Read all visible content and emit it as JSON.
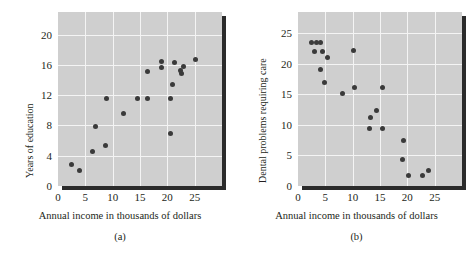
{
  "figure": {
    "background_color": "#ffffff",
    "plot_background_color": "#cfcfcf",
    "grid_color": "#f4f4f4",
    "point_color": "#3a3a3a",
    "axis_color": "#231f20"
  },
  "chart_data": [
    {
      "type": "scatter",
      "panel_label": "(a)",
      "title": "",
      "xlabel": "Annual income in thousands of dollars",
      "ylabel": "Years of education",
      "xlim": [
        0,
        30
      ],
      "ylim": [
        0,
        23
      ],
      "xticks": [
        0,
        5,
        10,
        15,
        20,
        25
      ],
      "xtick_labels": [
        "0",
        "5",
        "10",
        "15",
        "20",
        "25"
      ],
      "yticks": [
        0,
        4,
        8,
        12,
        16,
        20
      ],
      "ytick_labels": [
        "0",
        "4",
        "8",
        "12",
        "16",
        "20"
      ],
      "grid": true,
      "legend": "none",
      "points": [
        {
          "x": 2.5,
          "y": 2.8
        },
        {
          "x": 4.0,
          "y": 2.0
        },
        {
          "x": 6.4,
          "y": 4.6
        },
        {
          "x": 6.9,
          "y": 7.8
        },
        {
          "x": 8.6,
          "y": 5.3
        },
        {
          "x": 8.9,
          "y": 11.6
        },
        {
          "x": 12.0,
          "y": 9.6
        },
        {
          "x": 14.6,
          "y": 11.6
        },
        {
          "x": 16.3,
          "y": 11.6
        },
        {
          "x": 16.3,
          "y": 15.1
        },
        {
          "x": 18.9,
          "y": 15.6
        },
        {
          "x": 19.0,
          "y": 16.4
        },
        {
          "x": 20.6,
          "y": 11.6
        },
        {
          "x": 20.6,
          "y": 7.0
        },
        {
          "x": 21.0,
          "y": 13.4
        },
        {
          "x": 21.3,
          "y": 16.3
        },
        {
          "x": 22.4,
          "y": 15.3
        },
        {
          "x": 22.6,
          "y": 14.9
        },
        {
          "x": 22.9,
          "y": 15.8
        },
        {
          "x": 25.1,
          "y": 16.7
        }
      ]
    },
    {
      "type": "scatter",
      "panel_label": "(b)",
      "title": "",
      "xlabel": "Annual income in thousands of dollars",
      "ylabel": "Dental problems requiring care",
      "xlim": [
        0,
        30
      ],
      "ylim": [
        0,
        28.5
      ],
      "xticks": [
        0,
        5,
        10,
        15,
        20,
        25
      ],
      "xtick_labels": [
        "0",
        "5",
        "10",
        "15",
        "20",
        "25"
      ],
      "yticks": [
        0,
        5,
        10,
        15,
        20,
        25
      ],
      "ytick_labels": [
        "0",
        "5",
        "10",
        "15",
        "20",
        "25"
      ],
      "grid": true,
      "legend": "none",
      "points": [
        {
          "x": 2.5,
          "y": 23.5
        },
        {
          "x": 3.4,
          "y": 23.5
        },
        {
          "x": 4.2,
          "y": 23.5
        },
        {
          "x": 3.0,
          "y": 22.1
        },
        {
          "x": 4.5,
          "y": 22.1
        },
        {
          "x": 5.4,
          "y": 21.0
        },
        {
          "x": 4.2,
          "y": 19.1
        },
        {
          "x": 4.8,
          "y": 17.0
        },
        {
          "x": 8.1,
          "y": 15.2
        },
        {
          "x": 10.2,
          "y": 22.2
        },
        {
          "x": 10.3,
          "y": 16.1
        },
        {
          "x": 15.5,
          "y": 16.1
        },
        {
          "x": 13.2,
          "y": 11.2
        },
        {
          "x": 14.3,
          "y": 12.3
        },
        {
          "x": 13.1,
          "y": 9.4
        },
        {
          "x": 15.4,
          "y": 9.5
        },
        {
          "x": 19.3,
          "y": 7.5
        },
        {
          "x": 19.2,
          "y": 4.4
        },
        {
          "x": 20.2,
          "y": 1.7
        },
        {
          "x": 22.8,
          "y": 1.7
        },
        {
          "x": 23.9,
          "y": 2.5
        }
      ]
    }
  ]
}
